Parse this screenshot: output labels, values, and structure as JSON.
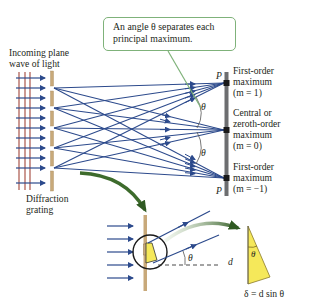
{
  "callout": {
    "line1": "An angle θ separates each",
    "line2": "principal maximum."
  },
  "labels": {
    "incoming_line1": "Incoming plane",
    "incoming_line2": "wave of light",
    "grating_line1": "Diffraction",
    "grating_line2": "grating",
    "point_top": "P",
    "point_bottom": "P",
    "theta_upper": "θ",
    "theta_lower": "θ",
    "theta_inset": "θ",
    "theta_triangle": "θ",
    "d_label": "d",
    "path_difference": "δ = d sin θ"
  },
  "maxima": [
    {
      "line1": "First-order",
      "line2": "maximum",
      "line3": "(m = 1)"
    },
    {
      "line1": "Central or",
      "line2": "zeroth-order",
      "line3": "maximum",
      "line4": "(m = 0)"
    },
    {
      "line1": "First-order",
      "line2": "maximum",
      "line3": "(m = −1)"
    }
  ],
  "colors": {
    "ray": "#2c4a8c",
    "wavefront": "#a2453a",
    "grating": "#c8a97a",
    "screen": "#6d6e70",
    "callout_border": "#7fb27a",
    "arrow_curve": "#3d6b2c",
    "triangle_fill": "#f5e85a"
  }
}
